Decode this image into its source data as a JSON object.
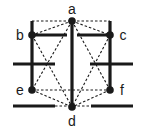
{
  "diagram": {
    "colors": {
      "line": "#1a1a1a",
      "background": "#ffffff"
    },
    "nodes": [
      {
        "id": "a",
        "label": "a",
        "x": 72,
        "y": 21,
        "lx": 72,
        "ly": 14
      },
      {
        "id": "b",
        "label": "b",
        "x": 32,
        "y": 35,
        "lx": 20,
        "ly": 40
      },
      {
        "id": "c",
        "label": "c",
        "x": 110,
        "y": 35,
        "lx": 123,
        "ly": 40
      },
      {
        "id": "e",
        "label": "e",
        "x": 32,
        "y": 90,
        "lx": 20,
        "ly": 95
      },
      {
        "id": "f",
        "label": "f",
        "x": 110,
        "y": 90,
        "lx": 122,
        "ly": 95
      },
      {
        "id": "d",
        "label": "d",
        "x": 72,
        "y": 107,
        "lx": 72,
        "ly": 126
      }
    ],
    "solid_lines": [
      {
        "x1": 32,
        "y1": 21,
        "x2": 32,
        "y2": 90
      },
      {
        "x1": 110,
        "y1": 21,
        "x2": 110,
        "y2": 90
      },
      {
        "x1": 72,
        "y1": 21,
        "x2": 72,
        "y2": 107
      },
      {
        "x1": 32,
        "y1": 35,
        "x2": 67,
        "y2": 35
      },
      {
        "x1": 77,
        "y1": 35,
        "x2": 110,
        "y2": 35
      },
      {
        "x1": 13,
        "y1": 64,
        "x2": 55,
        "y2": 64
      },
      {
        "x1": 90,
        "y1": 64,
        "x2": 133,
        "y2": 64
      },
      {
        "x1": 13,
        "y1": 106,
        "x2": 55,
        "y2": 106
      },
      {
        "x1": 91,
        "y1": 106,
        "x2": 133,
        "y2": 106
      }
    ],
    "dashed_lines": [
      {
        "x1": 32,
        "y1": 21,
        "x2": 110,
        "y2": 21
      },
      {
        "x1": 72,
        "y1": 21,
        "x2": 32,
        "y2": 35
      },
      {
        "x1": 72,
        "y1": 21,
        "x2": 110,
        "y2": 35
      },
      {
        "x1": 72,
        "y1": 21,
        "x2": 32,
        "y2": 90
      },
      {
        "x1": 72,
        "y1": 21,
        "x2": 110,
        "y2": 90
      },
      {
        "x1": 32,
        "y1": 35,
        "x2": 72,
        "y2": 107
      },
      {
        "x1": 110,
        "y1": 35,
        "x2": 72,
        "y2": 107
      },
      {
        "x1": 32,
        "y1": 90,
        "x2": 110,
        "y2": 90
      },
      {
        "x1": 32,
        "y1": 90,
        "x2": 72,
        "y2": 107
      },
      {
        "x1": 110,
        "y1": 90,
        "x2": 72,
        "y2": 107
      },
      {
        "x1": 55,
        "y1": 106,
        "x2": 91,
        "y2": 106
      }
    ]
  }
}
